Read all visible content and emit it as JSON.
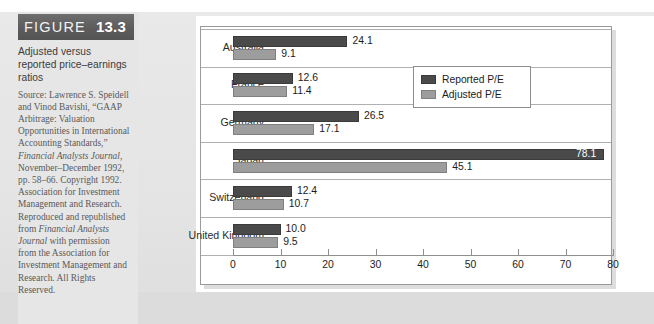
{
  "figure": {
    "banner_word": "FIGURE",
    "banner_number": "13.3",
    "title": "Adjusted versus reported price–earnings ratios",
    "source_lines": [
      "Source: Lawrence S.",
      "Speidell and Vinod",
      "Bavishi, “GAAP Arbitrage:",
      "Valuation Opportunities in",
      "International Accounting",
      "Standards,”",
      "Financial Analysts Journal,",
      "November–December",
      "1992, pp. 58–66.",
      "Copyright 1992.",
      "Association for Investment",
      "Management and Research.",
      "Reproduced and",
      "republished from",
      "Financial Analysts Journal",
      "with permission from the",
      "Association for Investment",
      "Management and Research.",
      "All Rights Reserved."
    ],
    "source_text": "Source: Lawrence S. Speidell and Vinod Bavishi, “GAAP Arbitrage: Valuation Opportunities in International Accounting Standards,” Financial Analysts Journal, November–December 1992, pp. 58–66. Copyright 1992. Association for Investment Management and Research. Reproduced and republished from Financial Analysts Journal with permission from the Association for Investment Management and Research. All Rights Reserved."
  },
  "legend": {
    "items": [
      {
        "label": "Reported P/E",
        "color": "#4a4a4a"
      },
      {
        "label": "Adjusted P/E",
        "color": "#9d9d9d"
      }
    ]
  },
  "chart_data": {
    "type": "bar",
    "orientation": "horizontal",
    "title": "Adjusted versus reported price–earnings ratios",
    "xlabel": "",
    "ylabel": "",
    "xlim": [
      0,
      80
    ],
    "xticks": [
      0,
      10,
      20,
      30,
      40,
      50,
      60,
      70,
      80
    ],
    "xtick_labels": [
      "0",
      "10",
      "20",
      "30",
      "40",
      "50",
      "60",
      "70",
      "80"
    ],
    "grid": false,
    "legend_position": "top-right",
    "categories": [
      "Australia",
      "France",
      "Germany",
      "Japan",
      "Switzerland",
      "United Kingdom"
    ],
    "series": [
      {
        "name": "Reported P/E",
        "color": "#4a4a4a",
        "values": [
          24.1,
          12.6,
          26.5,
          78.1,
          12.4,
          10.0
        ],
        "labels": [
          "24.1",
          "12.6",
          "26.5",
          "78.1",
          "12.4",
          "10.0"
        ]
      },
      {
        "name": "Adjusted P/E",
        "color": "#9d9d9d",
        "values": [
          9.1,
          11.4,
          17.1,
          45.1,
          10.7,
          9.5
        ],
        "labels": [
          "9.1",
          "11.4",
          "17.1",
          "45.1",
          "10.7",
          "9.5"
        ]
      }
    ]
  }
}
